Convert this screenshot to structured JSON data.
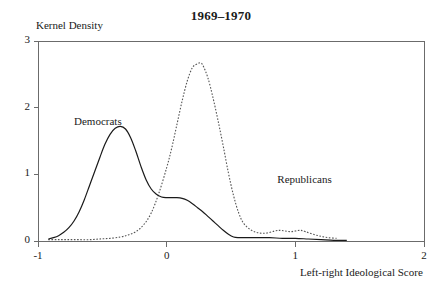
{
  "chart_data": {
    "type": "line",
    "title": "1969–1970",
    "xlabel": "Left-right Ideological Score",
    "ylabel": "Kernel Density",
    "xlim": [
      -1,
      2
    ],
    "ylim": [
      0,
      3
    ],
    "xticks": [
      "-1",
      "0",
      "1",
      "2"
    ],
    "xtick_values": [
      -1,
      0,
      1,
      2
    ],
    "yticks": [
      "0",
      "1",
      "2",
      "3"
    ],
    "ytick_values": [
      0,
      1,
      2,
      3
    ],
    "grid": false,
    "legend_position": "inline-annotations",
    "annotations": [
      {
        "text": "Democrats",
        "x": -0.72,
        "y": 1.78
      },
      {
        "text": "Republicans",
        "x": 0.86,
        "y": 0.92
      }
    ],
    "series": [
      {
        "name": "Democrats",
        "style": "solid",
        "color": "#1a1a1a",
        "x": [
          -0.92,
          -0.88,
          -0.84,
          -0.8,
          -0.76,
          -0.72,
          -0.68,
          -0.64,
          -0.6,
          -0.56,
          -0.52,
          -0.48,
          -0.44,
          -0.4,
          -0.36,
          -0.32,
          -0.28,
          -0.24,
          -0.2,
          -0.16,
          -0.12,
          -0.08,
          -0.04,
          0.0,
          0.04,
          0.08,
          0.12,
          0.16,
          0.2,
          0.24,
          0.28,
          0.32,
          0.36,
          0.4,
          0.44,
          0.48,
          0.52,
          0.56,
          0.6,
          0.7,
          0.8,
          0.9,
          1.0,
          1.1,
          1.2,
          1.3,
          1.4
        ],
        "y": [
          0.03,
          0.05,
          0.08,
          0.13,
          0.2,
          0.3,
          0.44,
          0.62,
          0.83,
          1.04,
          1.25,
          1.45,
          1.6,
          1.69,
          1.72,
          1.68,
          1.55,
          1.35,
          1.12,
          0.92,
          0.78,
          0.7,
          0.66,
          0.65,
          0.65,
          0.65,
          0.64,
          0.61,
          0.56,
          0.5,
          0.44,
          0.37,
          0.3,
          0.23,
          0.16,
          0.1,
          0.06,
          0.05,
          0.05,
          0.05,
          0.05,
          0.04,
          0.04,
          0.03,
          0.02,
          0.01,
          0.01
        ]
      },
      {
        "name": "Republicans",
        "style": "dotted",
        "color": "#555555",
        "x": [
          -0.92,
          -0.84,
          -0.76,
          -0.68,
          -0.6,
          -0.52,
          -0.44,
          -0.36,
          -0.3,
          -0.24,
          -0.18,
          -0.12,
          -0.06,
          0.0,
          0.04,
          0.08,
          0.12,
          0.16,
          0.2,
          0.24,
          0.26,
          0.28,
          0.32,
          0.36,
          0.4,
          0.44,
          0.48,
          0.52,
          0.56,
          0.6,
          0.66,
          0.72,
          0.78,
          0.84,
          0.88,
          0.92,
          0.96,
          1.0,
          1.04,
          1.08,
          1.14,
          1.2,
          1.26,
          1.32
        ],
        "y": [
          0.02,
          0.02,
          0.02,
          0.02,
          0.02,
          0.03,
          0.04,
          0.06,
          0.09,
          0.14,
          0.24,
          0.42,
          0.72,
          1.1,
          1.4,
          1.75,
          2.1,
          2.4,
          2.6,
          2.66,
          2.67,
          2.64,
          2.45,
          2.15,
          1.8,
          1.42,
          1.02,
          0.68,
          0.42,
          0.26,
          0.16,
          0.12,
          0.12,
          0.15,
          0.16,
          0.15,
          0.14,
          0.15,
          0.16,
          0.14,
          0.1,
          0.07,
          0.05,
          0.04
        ]
      }
    ]
  },
  "axes": {
    "left_px": 38,
    "right_px": 424,
    "top_px": 41,
    "bottom_px": 241
  }
}
